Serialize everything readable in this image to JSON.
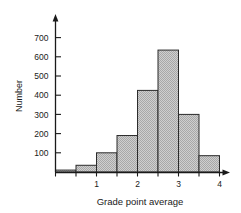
{
  "chart_data": {
    "type": "bar",
    "title": "",
    "xlabel": "Grade point average",
    "ylabel": "Number",
    "categories": [
      "0.0-0.5",
      "0.5-1.0",
      "1.0-1.5",
      "1.5-2.0",
      "2.0-2.5",
      "2.5-3.0",
      "3.0-3.5",
      "3.5-4.0"
    ],
    "bin_edges": [
      0.0,
      0.5,
      1.0,
      1.5,
      2.0,
      2.5,
      3.0,
      3.5,
      4.0
    ],
    "bin_width": 0.5,
    "values": [
      10,
      35,
      100,
      190,
      425,
      635,
      300,
      85
    ],
    "xlim": [
      0,
      4
    ],
    "ylim": [
      0,
      740
    ],
    "xticks": [
      1,
      2,
      3,
      4
    ],
    "xtick_labels": [
      "1",
      "2",
      "3",
      "4"
    ],
    "yticks": [
      100,
      200,
      300,
      400,
      500,
      600,
      700
    ],
    "ytick_labels": [
      "100",
      "200",
      "300",
      "400",
      "500",
      "600",
      "700"
    ],
    "grid": false,
    "legend": null,
    "bar_fill": "#c6c6c6",
    "bar_edge": "#2b2b2b",
    "axis_color": "#1a1a1a"
  },
  "axes": {
    "y_axis_name": "Number",
    "x_axis_name": "Grade point average"
  }
}
